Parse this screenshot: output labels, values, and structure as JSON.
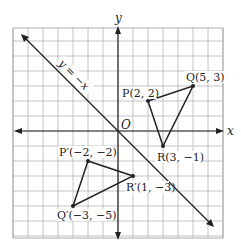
{
  "diagram": {
    "type": "coordinate-plane-reflection",
    "axes": {
      "x_label": "x",
      "y_label": "y",
      "origin_label": "O"
    },
    "grid": {
      "x_min": -7,
      "x_max": 7,
      "y_min": -7,
      "y_max": 7,
      "step": 1
    },
    "line": {
      "label": "y = −x",
      "equation": "y = -x"
    },
    "triangle_original": {
      "points": [
        {
          "name": "P",
          "x": 2,
          "y": 2,
          "label": "P(2, 2)"
        },
        {
          "name": "Q",
          "x": 5,
          "y": 3,
          "label": "Q(5, 3)"
        },
        {
          "name": "R",
          "x": 3,
          "y": -1,
          "label": "R(3, −1)"
        }
      ]
    },
    "triangle_image": {
      "points": [
        {
          "name": "P'",
          "x": -2,
          "y": -2,
          "label": "P′(−2, −2)"
        },
        {
          "name": "Q'",
          "x": -3,
          "y": -5,
          "label": "Q′(−3, −5)"
        },
        {
          "name": "R'",
          "x": 1,
          "y": -3,
          "label": "R′(1, −3)"
        }
      ]
    }
  }
}
